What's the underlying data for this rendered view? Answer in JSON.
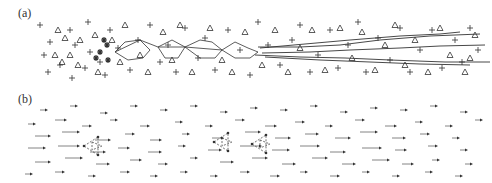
{
  "figure": {
    "panels": [
      {
        "id": "a",
        "label": "(a)",
        "description": "particle configuration with trajectories"
      },
      {
        "id": "b",
        "label": "(b)",
        "description": "displacement arrow field"
      }
    ],
    "colors": {
      "ink": "#333333",
      "light": "#777777",
      "background": "#ffffff"
    }
  },
  "panel_a": {
    "plus_markers": [
      [
        40,
        25
      ],
      [
        70,
        30
      ],
      [
        88,
        22
      ],
      [
        50,
        42
      ],
      [
        75,
        45
      ],
      [
        44,
        55
      ],
      [
        90,
        52
      ],
      [
        60,
        65
      ],
      [
        85,
        68
      ],
      [
        48,
        72
      ],
      [
        100,
        62
      ],
      [
        72,
        78
      ],
      [
        110,
        30
      ],
      [
        118,
        48
      ],
      [
        105,
        75
      ],
      [
        130,
        70
      ],
      [
        138,
        40
      ],
      [
        150,
        25
      ],
      [
        160,
        62
      ],
      [
        168,
        45
      ],
      [
        176,
        72
      ],
      [
        185,
        28
      ],
      [
        198,
        58
      ],
      [
        205,
        38
      ],
      [
        215,
        70
      ],
      [
        228,
        30
      ],
      [
        240,
        50
      ],
      [
        250,
        75
      ],
      [
        258,
        22
      ],
      [
        268,
        45
      ],
      [
        280,
        65
      ],
      [
        292,
        40
      ],
      [
        300,
        25
      ],
      [
        310,
        72
      ],
      [
        318,
        55
      ],
      [
        330,
        30
      ],
      [
        338,
        68
      ],
      [
        348,
        45
      ],
      [
        358,
        22
      ],
      [
        366,
        72
      ],
      [
        378,
        38
      ],
      [
        390,
        60
      ],
      [
        400,
        28
      ],
      [
        410,
        72
      ],
      [
        420,
        50
      ],
      [
        432,
        30
      ],
      [
        442,
        68
      ],
      [
        455,
        40
      ],
      [
        462,
        62
      ],
      [
        470,
        28
      ],
      [
        478,
        50
      ]
    ],
    "triangle_markers": [
      [
        58,
        30
      ],
      [
        65,
        38
      ],
      [
        55,
        55
      ],
      [
        62,
        62
      ],
      [
        80,
        40
      ],
      [
        70,
        55
      ],
      [
        95,
        35
      ],
      [
        78,
        65
      ],
      [
        98,
        72
      ],
      [
        112,
        40
      ],
      [
        120,
        62
      ],
      [
        125,
        25
      ],
      [
        140,
        55
      ],
      [
        148,
        72
      ],
      [
        163,
        32
      ],
      [
        172,
        60
      ],
      [
        180,
        25
      ],
      [
        192,
        72
      ],
      [
        210,
        28
      ],
      [
        222,
        60
      ],
      [
        232,
        72
      ],
      [
        245,
        32
      ],
      [
        262,
        65
      ],
      [
        275,
        30
      ],
      [
        288,
        72
      ],
      [
        300,
        48
      ],
      [
        312,
        30
      ],
      [
        325,
        70
      ],
      [
        340,
        28
      ],
      [
        352,
        58
      ],
      [
        362,
        32
      ],
      [
        375,
        70
      ],
      [
        385,
        45
      ],
      [
        395,
        25
      ],
      [
        405,
        65
      ],
      [
        415,
        40
      ],
      [
        428,
        72
      ],
      [
        440,
        28
      ],
      [
        450,
        55
      ],
      [
        465,
        72
      ],
      [
        475,
        35
      ],
      [
        470,
        58
      ]
    ],
    "star_markers": [
      [
        100,
        52
      ],
      [
        107,
        45
      ],
      [
        108,
        60
      ],
      [
        96,
        58
      ],
      [
        104,
        40
      ]
    ],
    "chain_path": [
      [
        115,
        52
      ],
      [
        125,
        42
      ],
      [
        140,
        40
      ],
      [
        150,
        50
      ],
      [
        143,
        58
      ],
      [
        128,
        60
      ],
      [
        115,
        52
      ],
      [
        140,
        40
      ],
      [
        158,
        47
      ],
      [
        172,
        40
      ],
      [
        185,
        47
      ],
      [
        178,
        58
      ],
      [
        165,
        58
      ],
      [
        158,
        47
      ],
      [
        185,
        47
      ],
      [
        200,
        40
      ],
      [
        212,
        42
      ],
      [
        222,
        50
      ],
      [
        215,
        58
      ],
      [
        200,
        58
      ],
      [
        185,
        47
      ],
      [
        222,
        50
      ],
      [
        235,
        42
      ],
      [
        248,
        48
      ],
      [
        258,
        52
      ],
      [
        250,
        58
      ],
      [
        235,
        58
      ],
      [
        222,
        50
      ]
    ],
    "trajectories": [
      [
        [
          258,
          47
        ],
        [
          300,
          47
        ],
        [
          340,
          45
        ],
        [
          380,
          40
        ],
        [
          430,
          36
        ],
        [
          480,
          34
        ]
      ],
      [
        [
          262,
          53
        ],
        [
          310,
          52
        ],
        [
          350,
          50
        ],
        [
          400,
          48
        ],
        [
          440,
          46
        ],
        [
          485,
          45
        ]
      ],
      [
        [
          255,
          55
        ],
        [
          300,
          57
        ],
        [
          345,
          58
        ],
        [
          390,
          60
        ],
        [
          445,
          62
        ],
        [
          490,
          62
        ]
      ],
      [
        [
          260,
          48
        ],
        [
          305,
          44
        ],
        [
          350,
          40
        ],
        [
          400,
          36
        ],
        [
          440,
          34
        ],
        [
          460,
          32
        ]
      ],
      [
        [
          265,
          57
        ],
        [
          320,
          60
        ],
        [
          370,
          62
        ],
        [
          420,
          64
        ],
        [
          470,
          65
        ]
      ]
    ]
  },
  "panel_b": {
    "arrows": [
      [
        40,
        22,
        6
      ],
      [
        70,
        18,
        6
      ],
      [
        100,
        25,
        6
      ],
      [
        130,
        18,
        6
      ],
      [
        160,
        22,
        6
      ],
      [
        190,
        18,
        6
      ],
      [
        220,
        24,
        6
      ],
      [
        250,
        20,
        6
      ],
      [
        280,
        22,
        6
      ],
      [
        310,
        18,
        6
      ],
      [
        340,
        24,
        6
      ],
      [
        370,
        20,
        6
      ],
      [
        400,
        22,
        6
      ],
      [
        430,
        18,
        6
      ],
      [
        460,
        24,
        6
      ],
      [
        28,
        36,
        6
      ],
      [
        55,
        32,
        10
      ],
      [
        82,
        38,
        8
      ],
      [
        110,
        32,
        6
      ],
      [
        140,
        38,
        8
      ],
      [
        175,
        34,
        6
      ],
      [
        205,
        38,
        6
      ],
      [
        235,
        32,
        8
      ],
      [
        265,
        38,
        10
      ],
      [
        295,
        34,
        8
      ],
      [
        325,
        38,
        6
      ],
      [
        355,
        32,
        8
      ],
      [
        385,
        38,
        10
      ],
      [
        415,
        34,
        6
      ],
      [
        445,
        38,
        6
      ],
      [
        475,
        32,
        6
      ],
      [
        35,
        48,
        14
      ],
      [
        62,
        44,
        16
      ],
      [
        95,
        52,
        14
      ],
      [
        125,
        46,
        8
      ],
      [
        150,
        52,
        10
      ],
      [
        182,
        46,
        6
      ],
      [
        212,
        50,
        10
      ],
      [
        245,
        44,
        14
      ],
      [
        275,
        50,
        14
      ],
      [
        305,
        46,
        12
      ],
      [
        335,
        50,
        14
      ],
      [
        360,
        44,
        16
      ],
      [
        392,
        50,
        12
      ],
      [
        420,
        46,
        8
      ],
      [
        452,
        50,
        6
      ],
      [
        28,
        60,
        16
      ],
      [
        58,
        58,
        20
      ],
      [
        90,
        64,
        14
      ],
      [
        118,
        60,
        10
      ],
      [
        148,
        64,
        12
      ],
      [
        178,
        58,
        6
      ],
      [
        208,
        62,
        12
      ],
      [
        240,
        58,
        20
      ],
      [
        272,
        62,
        16
      ],
      [
        300,
        58,
        18
      ],
      [
        330,
        64,
        14
      ],
      [
        362,
        60,
        18
      ],
      [
        395,
        62,
        10
      ],
      [
        428,
        58,
        8
      ],
      [
        460,
        62,
        6
      ],
      [
        35,
        74,
        14
      ],
      [
        65,
        70,
        16
      ],
      [
        96,
        76,
        12
      ],
      [
        130,
        72,
        10
      ],
      [
        158,
        76,
        8
      ],
      [
        190,
        70,
        6
      ],
      [
        220,
        74,
        12
      ],
      [
        252,
        70,
        14
      ],
      [
        282,
        76,
        12
      ],
      [
        312,
        70,
        14
      ],
      [
        342,
        76,
        12
      ],
      [
        372,
        72,
        16
      ],
      [
        402,
        76,
        10
      ],
      [
        432,
        72,
        6
      ],
      [
        465,
        76,
        6
      ],
      [
        25,
        86,
        6
      ],
      [
        55,
        84,
        8
      ],
      [
        88,
        88,
        6
      ],
      [
        120,
        84,
        8
      ],
      [
        150,
        88,
        6
      ],
      [
        180,
        84,
        6
      ],
      [
        210,
        88,
        6
      ],
      [
        240,
        84,
        8
      ],
      [
        270,
        88,
        8
      ],
      [
        300,
        84,
        6
      ],
      [
        330,
        88,
        8
      ],
      [
        362,
        84,
        6
      ],
      [
        392,
        88,
        6
      ],
      [
        425,
        84,
        6
      ],
      [
        455,
        88,
        6
      ]
    ],
    "clusters": [
      {
        "cx": 92,
        "cy": 58
      },
      {
        "cx": 222,
        "cy": 54
      },
      {
        "cx": 260,
        "cy": 56
      }
    ]
  }
}
